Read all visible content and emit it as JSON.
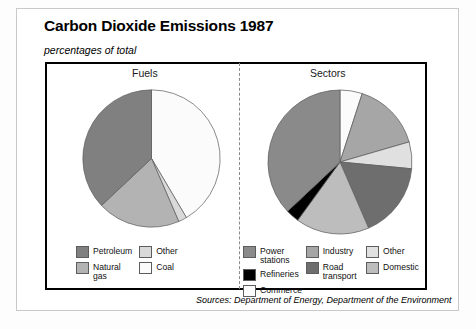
{
  "header": {
    "title": "Carbon Dioxide Emissions 1987",
    "subtitle": "percentages of total"
  },
  "panels": {
    "left_label": "Fuels",
    "right_label": "Sectors"
  },
  "source": "Sources: Department of Energy, Department of the Environment",
  "colors": {
    "petroleum": "#808080",
    "natural_gas": "#b3b3b3",
    "other_fuel": "#d9d9d9",
    "coal": "#fbfbfb",
    "power_stations": "#8a8a8a",
    "refineries": "#000000",
    "industry": "#a6a6a6",
    "road_transport": "#6e6e6e",
    "other_sector": "#e0e0e0",
    "domestic": "#bdbdbd",
    "commerce": "#fbfbfb",
    "outline": "#5d5d5d",
    "panel_border": "#000000",
    "divider": "#8a8a8a"
  },
  "legends": {
    "fuels": [
      {
        "label": "Petroleum",
        "color": "#808080"
      },
      {
        "label": "Other",
        "color": "#d9d9d9"
      },
      {
        "label": "Natural\ngas",
        "color": "#b3b3b3"
      },
      {
        "label": "Coal",
        "color": "#fbfbfb"
      }
    ],
    "sectors": [
      {
        "label": "Power\nstations",
        "color": "#8a8a8a"
      },
      {
        "label": "Industry",
        "color": "#a6a6a6"
      },
      {
        "label": "Other",
        "color": "#e0e0e0"
      },
      {
        "label": "Commerce",
        "color": "#fbfbfb"
      },
      {
        "label": "Refineries",
        "color": "#000000"
      },
      {
        "label": "Road\ntransport",
        "color": "#6e6e6e"
      },
      {
        "label": "Domestic",
        "color": "#bdbdbd"
      }
    ]
  },
  "chart_data": [
    {
      "type": "pie",
      "title": "Fuels",
      "subtitle": "percentages of total",
      "units": "percent",
      "start_angle_deg": 0,
      "direction": "clockwise",
      "categories": [
        "Coal",
        "Other",
        "Natural gas",
        "Petroleum"
      ],
      "values": [
        41.5,
        2.0,
        19.5,
        37.0
      ],
      "colors": [
        "#fbfbfb",
        "#d9d9d9",
        "#b3b3b3",
        "#808080"
      ],
      "legend_position": "bottom"
    },
    {
      "type": "pie",
      "title": "Sectors",
      "subtitle": "percentages of total",
      "units": "percent",
      "start_angle_deg": 0,
      "direction": "clockwise",
      "categories": [
        "Commerce",
        "Industry",
        "Other",
        "Road transport",
        "Domestic",
        "Refineries",
        "Power stations"
      ],
      "values": [
        5.0,
        15.5,
        6.0,
        17.0,
        16.5,
        3.0,
        37.0
      ],
      "colors": [
        "#fbfbfb",
        "#a6a6a6",
        "#e0e0e0",
        "#6e6e6e",
        "#bdbdbd",
        "#000000",
        "#8a8a8a"
      ],
      "legend_position": "bottom"
    }
  ]
}
